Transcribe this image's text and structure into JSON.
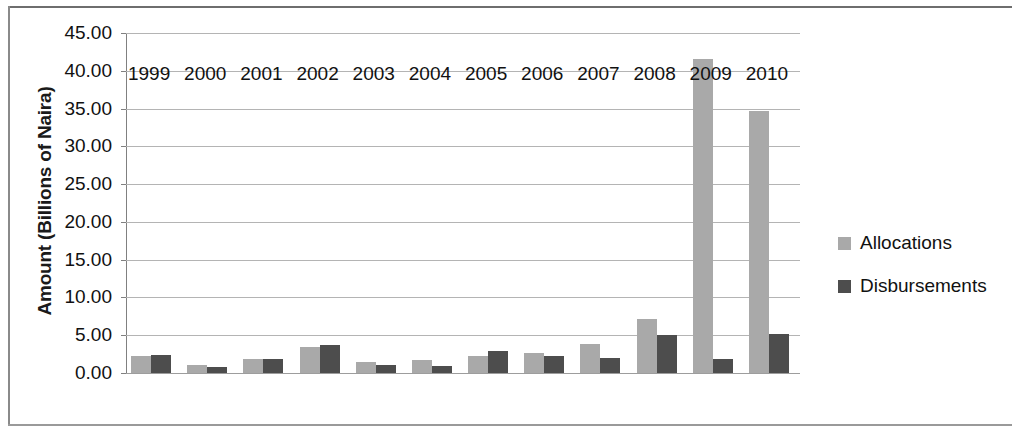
{
  "chart_data": {
    "type": "bar",
    "title": "",
    "subtitle": "",
    "xlabel": "",
    "ylabel": "Amount (Billions of Naira)",
    "categories": [
      "1999",
      "2000",
      "2001",
      "2002",
      "2003",
      "2004",
      "2005",
      "2006",
      "2007",
      "2008",
      "2009",
      "2010"
    ],
    "series": [
      {
        "name": "Allocations",
        "color": "#a9a9a9",
        "values": [
          2.3,
          1.1,
          1.8,
          3.4,
          1.5,
          1.7,
          2.3,
          2.7,
          3.9,
          7.2,
          41.5,
          34.7
        ]
      },
      {
        "name": "Disbursements",
        "color": "#4d4d4d",
        "values": [
          2.35,
          0.8,
          1.8,
          3.7,
          1.0,
          0.9,
          2.9,
          2.3,
          2.0,
          5.0,
          1.9,
          5.2
        ]
      }
    ],
    "ylim": [
      0,
      45
    ],
    "ytick_values": [
      0,
      5,
      10,
      15,
      20,
      25,
      30,
      35,
      40,
      45
    ],
    "ytick_labels": [
      "0.00",
      "5.00",
      "10.00",
      "15.00",
      "20.00",
      "25.00",
      "30.00",
      "35.00",
      "40.00",
      "45.00"
    ],
    "grid": true,
    "legend_position": "right",
    "legend": [
      "Allocations",
      "Disbursements"
    ]
  }
}
